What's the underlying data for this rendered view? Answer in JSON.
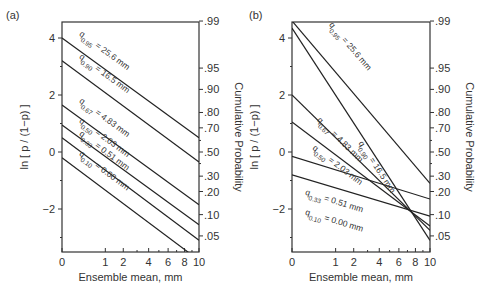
{
  "chart_data": [
    {
      "type": "line",
      "panel_label": "(a)",
      "xlabel": "Ensemble mean, mm",
      "ylabel": "ln [ p / (1−p) ]",
      "y2label": "Cumulative Probability",
      "x_scale": "sqrt",
      "xticks": [
        0,
        1,
        2,
        4,
        6,
        8,
        10
      ],
      "yticks": [
        4,
        2,
        0,
        -2
      ],
      "y2ticks": [
        ".99",
        ".95",
        ".90",
        ".80",
        ".70",
        ".50",
        ".30",
        ".20",
        ".10",
        ".05"
      ],
      "xlim": [
        0,
        10
      ],
      "ylim": [
        -3.5,
        4.6
      ],
      "series": [
        {
          "name": "q0.95 = 25.6 mm",
          "sub": "0.95",
          "value": "= 25.6 mm",
          "y_at_0": 4.0,
          "y_at_10": 0.5
        },
        {
          "name": "q0.90 = 16.5 mm",
          "sub": "0.90",
          "value": "= 16.5 mm",
          "y_at_0": 3.2,
          "y_at_10": -0.35
        },
        {
          "name": "q0.67 = 4.83 mm",
          "sub": "0.67",
          "value": "= 4.83 mm",
          "y_at_0": 1.65,
          "y_at_10": -1.85
        },
        {
          "name": "q0.50 = 2.03 mm",
          "sub": "0.50",
          "value": "= 2.03 mm",
          "y_at_0": 0.95,
          "y_at_10": -2.55
        },
        {
          "name": "q0.33 = 0.51 mm",
          "sub": "0.33",
          "value": "= 0.51 mm",
          "y_at_0": 0.5,
          "y_at_10": -3.1
        },
        {
          "name": "q0.10 = 0.00 mm",
          "sub": "0.10",
          "value": "= 0.00 mm",
          "y_at_0": -0.2,
          "y_at_10": -3.8
        }
      ]
    },
    {
      "type": "line",
      "panel_label": "(b)",
      "xlabel": "Ensemble mean, mm",
      "ylabel": "ln [ p / (1−p) ]",
      "y2label": "Cumulative Probability",
      "x_scale": "sqrt",
      "xticks": [
        0,
        1,
        2,
        4,
        6,
        8,
        10
      ],
      "yticks": [
        4,
        2,
        0,
        -2
      ],
      "y2ticks": [
        ".99",
        ".95",
        ".90",
        ".80",
        ".70",
        ".50",
        ".30",
        ".20",
        ".10",
        ".05"
      ],
      "xlim": [
        0,
        10
      ],
      "ylim": [
        -3.5,
        4.6
      ],
      "series": [
        {
          "name": "q0.95 = 25.6 mm",
          "sub": "0.95",
          "value": "= 25.6 mm",
          "y_at_0": 4.6,
          "y_at_10": -1.1
        },
        {
          "name": "q0.90 = 16.5 mm",
          "sub": "0.90",
          "value": "= 16.5 mm",
          "y_at_0": 4.35,
          "y_at_10": -3.1
        },
        {
          "name": "q0.67 = 4.83 mm",
          "sub": "0.67",
          "value": "= 4.83 mm",
          "y_at_0": 2.0,
          "y_at_10": -2.75
        },
        {
          "name": "q0.50 = 2.03 mm",
          "sub": "0.50",
          "value": "= 2.03 mm",
          "y_at_0": 1.05,
          "y_at_10": -2.6
        },
        {
          "name": "q0.33 = 0.51 mm",
          "sub": "0.33",
          "value": "= 0.51 mm",
          "y_at_0": -0.15,
          "y_at_10": -1.65
        },
        {
          "name": "q0.10 = 0.00 mm",
          "sub": "0.10",
          "value": "= 0.00 mm",
          "y_at_0": -0.8,
          "y_at_10": -2.25
        }
      ]
    }
  ]
}
